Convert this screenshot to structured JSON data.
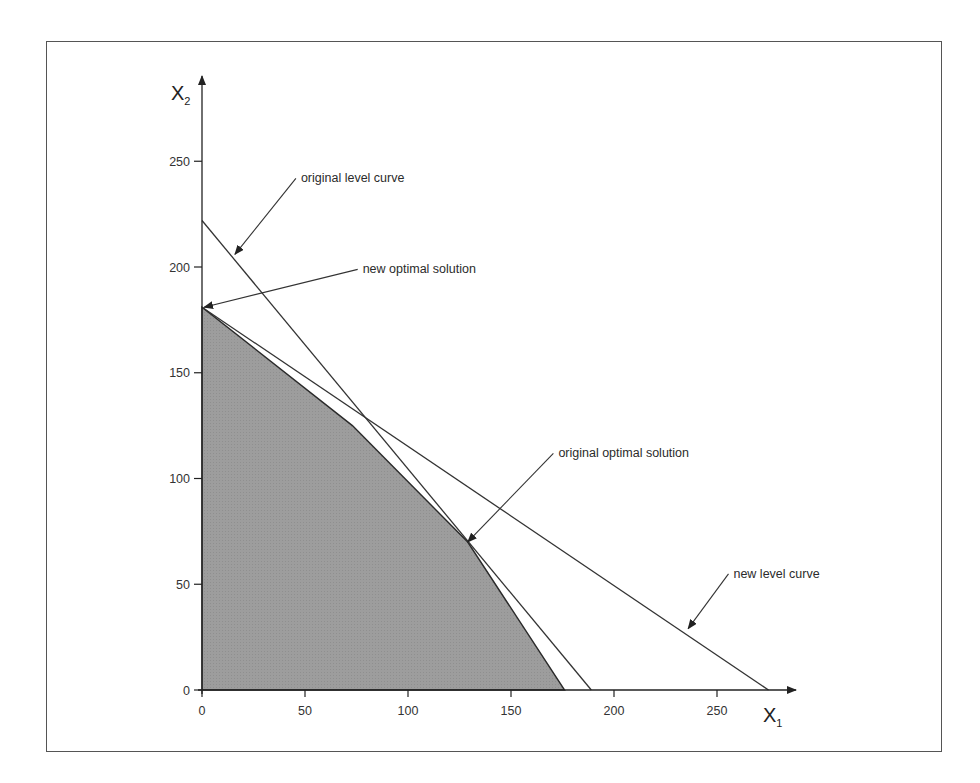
{
  "chart_data": {
    "type": "line",
    "title": "",
    "xlabel": "X1",
    "ylabel": "X2",
    "xlabel_main": "X",
    "xlabel_sub": "1",
    "ylabel_main": "X",
    "ylabel_sub": "2",
    "xlim": [
      0,
      290
    ],
    "ylim": [
      0,
      265
    ],
    "x_ticks": [
      0,
      50,
      100,
      150,
      200,
      250
    ],
    "y_ticks": [
      0,
      50,
      100,
      150,
      200,
      250
    ],
    "x_tick_labels": [
      "0",
      "50",
      "100",
      "150",
      "200",
      "250"
    ],
    "y_tick_labels": [
      "0",
      "50",
      "100",
      "150",
      "200",
      "250"
    ],
    "grid": false,
    "legend": null,
    "series": [
      {
        "name": "feasible region",
        "kind": "filled-polygon",
        "color": "#9a9a9a",
        "points": [
          [
            0,
            0
          ],
          [
            0,
            181
          ],
          [
            73,
            125
          ],
          [
            129,
            70
          ],
          [
            176,
            0
          ]
        ]
      },
      {
        "name": "original level curve",
        "kind": "line",
        "color": "#333333",
        "points": [
          [
            0,
            222
          ],
          [
            189,
            0
          ]
        ]
      },
      {
        "name": "new level curve",
        "kind": "line",
        "color": "#333333",
        "points": [
          [
            0,
            181
          ],
          [
            275,
            0
          ]
        ]
      }
    ],
    "annotations": [
      {
        "text": "original level curve",
        "label_at": [
          48,
          240
        ],
        "arrow_to": [
          16,
          206
        ]
      },
      {
        "text": "new optimal solution",
        "label_at": [
          78,
          197
        ],
        "arrow_to": [
          1,
          181
        ]
      },
      {
        "text": "original optimal solution",
        "label_at": [
          173,
          110
        ],
        "arrow_to": [
          129,
          70
        ]
      },
      {
        "text": "new level curve",
        "label_at": [
          258,
          53
        ],
        "arrow_to": [
          236,
          29
        ]
      }
    ]
  }
}
